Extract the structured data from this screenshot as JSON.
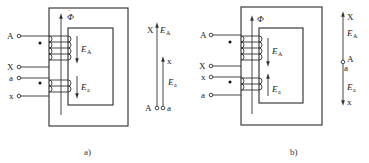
{
  "figure": {
    "panels": [
      {
        "id": "a",
        "caption": "a)",
        "flux_label": "Φ",
        "terminals": [
          "A",
          "X",
          "a",
          "x"
        ],
        "emf_labels": {
          "primary": "E",
          "primary_sub": "A",
          "secondary": "E",
          "secondary_sub": "a"
        },
        "phasor": {
          "top_label": "X",
          "emf_primary": "E",
          "emf_primary_sub": "A",
          "emf_secondary": "E",
          "emf_secondary_sub": "a",
          "mid_label": "x",
          "bottom_left": "A",
          "bottom_right": "a"
        }
      },
      {
        "id": "b",
        "caption": "b)",
        "flux_label": "Φ",
        "terminals": [
          "A",
          "X",
          "x",
          "a"
        ],
        "emf_labels": {
          "primary": "E",
          "primary_sub": "A",
          "secondary": "E",
          "secondary_sub": "a"
        },
        "phasor": {
          "top_label": "X",
          "emf_primary": "E",
          "emf_primary_sub": "A",
          "node_right": "A",
          "node_left": "a",
          "emf_secondary": "E",
          "emf_secondary_sub": "a",
          "bottom_label": "x"
        }
      }
    ]
  }
}
